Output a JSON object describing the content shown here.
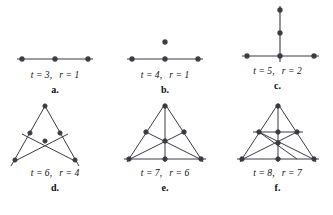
{
  "figure": {
    "ink_color": "#3a3a44",
    "text_color": "#0d0d0d",
    "background": "#ffffff",
    "panels": [
      {
        "id": "a",
        "caption": "a.",
        "t_label": "t = 3,",
        "r_label": "r = 1",
        "t_value": 3,
        "r_value": 1,
        "description": "one line with three marked points"
      },
      {
        "id": "b",
        "caption": "b.",
        "t_label": "t = 4,",
        "r_label": "r = 1",
        "t_value": 4,
        "r_value": 1,
        "description": "one line with three marked points and one isolated point above"
      },
      {
        "id": "c",
        "caption": "c.",
        "t_label": "t = 5,",
        "r_label": "r = 2",
        "t_value": 5,
        "r_value": 2,
        "description": "two perpendicular lines forming a cross with five marked points"
      },
      {
        "id": "d",
        "caption": "d.",
        "t_label": "t = 6,",
        "r_label": "r = 4",
        "t_value": 6,
        "r_value": 4,
        "description": "four lines meeting in six marked points"
      },
      {
        "id": "e",
        "caption": "e.",
        "t_label": "t = 7,",
        "r_label": "r = 6",
        "t_value": 7,
        "r_value": 6,
        "description": "triangle with three medians, seven marked points"
      },
      {
        "id": "f",
        "caption": "f.",
        "t_label": "t = 8,",
        "r_label": "r = 7",
        "t_value": 8,
        "r_value": 7,
        "description": "triangle with three medians and a midline, eight marked points"
      }
    ]
  }
}
